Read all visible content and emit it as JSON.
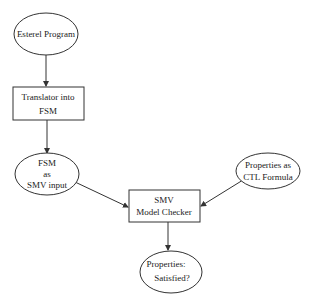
{
  "diagram": {
    "type": "flowchart",
    "nodes": [
      {
        "id": "esterel",
        "shape": "ellipse",
        "lines": [
          "Esterel Program"
        ]
      },
      {
        "id": "translator",
        "shape": "rect",
        "lines": [
          "Translator into",
          "FSM"
        ]
      },
      {
        "id": "fsm",
        "shape": "ellipse",
        "lines": [
          "FSM",
          "as",
          "SMV input"
        ]
      },
      {
        "id": "ctl",
        "shape": "ellipse",
        "lines": [
          "Properties as",
          "CTL Formula"
        ]
      },
      {
        "id": "smv",
        "shape": "rect",
        "lines": [
          "SMV",
          "Model Checker"
        ]
      },
      {
        "id": "result",
        "shape": "ellipse",
        "lines": [
          "Properties:",
          "Satisfied?"
        ]
      }
    ],
    "edges": [
      {
        "from": "esterel",
        "to": "translator"
      },
      {
        "from": "translator",
        "to": "fsm"
      },
      {
        "from": "fsm",
        "to": "smv"
      },
      {
        "from": "ctl",
        "to": "smv"
      },
      {
        "from": "smv",
        "to": "result"
      }
    ],
    "colors": {
      "stroke": "#333333",
      "text": "#222222",
      "background": "#ffffff"
    }
  }
}
